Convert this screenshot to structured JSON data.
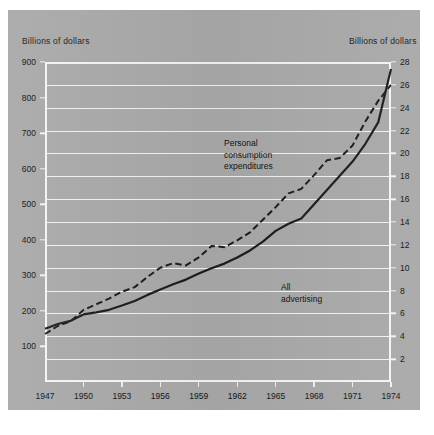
{
  "figure": {
    "left_header": "Billions of dollars",
    "right_header": "Billions of dollars"
  },
  "annotations": {
    "pce_line1": "Personal",
    "pce_line2": "consumption",
    "pce_line3": "expenditures",
    "adv_line1": "All",
    "adv_line2": "advertising"
  },
  "colors": {
    "panel": "#a9a9a9",
    "gridline": "#f2f2f2",
    "series_solid": "#1c1c1c",
    "series_dashed": "#1c1c1c",
    "text": "#141414"
  },
  "chart_data": {
    "type": "line",
    "title": "",
    "xlabel": "",
    "ylabel": "Billions of dollars",
    "y2label": "Billions of dollars",
    "grid": true,
    "legend": "annotated-inline",
    "xlim": [
      1947,
      1974
    ],
    "ylim": [
      0,
      900
    ],
    "y2lim": [
      0,
      28
    ],
    "xticks": [
      1947,
      1950,
      1953,
      1956,
      1959,
      1962,
      1965,
      1968,
      1971,
      1974
    ],
    "xticklabels": [
      "1947",
      "1950",
      "1953",
      "1956",
      "1959",
      "1962",
      "1965",
      "1968",
      "1971",
      "1974"
    ],
    "yticks": [
      100,
      200,
      300,
      400,
      500,
      600,
      700,
      800,
      900
    ],
    "yticklabels": [
      "100",
      "200",
      "300",
      "400",
      "500",
      "600",
      "700",
      "800",
      "900"
    ],
    "y2ticks": [
      2,
      4,
      6,
      8,
      10,
      12,
      14,
      16,
      18,
      20,
      22,
      24,
      26,
      28
    ],
    "y2ticklabels": [
      "2",
      "4",
      "6",
      "8",
      "10",
      "12",
      "14",
      "16",
      "18",
      "20",
      "22",
      "24",
      "26",
      "28"
    ],
    "x": [
      1947,
      1948,
      1949,
      1950,
      1951,
      1952,
      1953,
      1954,
      1955,
      1956,
      1957,
      1958,
      1959,
      1960,
      1961,
      1962,
      1963,
      1964,
      1965,
      1966,
      1967,
      1968,
      1969,
      1970,
      1971,
      1972,
      1973,
      1974
    ],
    "series": [
      {
        "name": "Personal consumption expenditures",
        "axis": "left",
        "style": "solid",
        "values": [
          150,
          163,
          172,
          190,
          196,
          203,
          215,
          228,
          245,
          260,
          275,
          288,
          305,
          320,
          333,
          350,
          370,
          395,
          425,
          445,
          460,
          500,
          540,
          580,
          620,
          670,
          730,
          880
        ]
      },
      {
        "name": "All advertising",
        "axis": "right",
        "style": "dashed",
        "values": [
          4.2,
          4.9,
          5.3,
          6.3,
          6.8,
          7.3,
          7.9,
          8.3,
          9.2,
          10.0,
          10.4,
          10.2,
          10.9,
          11.9,
          11.8,
          12.4,
          13.1,
          14.2,
          15.3,
          16.5,
          16.9,
          18.1,
          19.4,
          19.6,
          20.7,
          22.8,
          24.6,
          26.0
        ]
      }
    ]
  }
}
